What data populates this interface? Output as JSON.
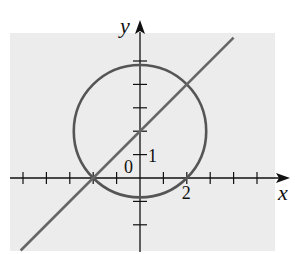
{
  "chart_data": {
    "type": "line",
    "title": "",
    "xlabel": "x",
    "ylabel": "y",
    "xlim": [
      -5.5,
      6.2
    ],
    "ylim": [
      -3.1,
      6.0
    ],
    "grid": false,
    "background": "#ececec",
    "tick_labels": {
      "x": [
        {
          "value": 2,
          "label": "2"
        }
      ],
      "y": [
        {
          "value": 1,
          "label": "1"
        }
      ],
      "origin": "0"
    },
    "x_ticks": [
      -5,
      -4,
      -3,
      -2,
      -1,
      1,
      2,
      3,
      4,
      5
    ],
    "y_ticks": [
      -2,
      -1,
      1,
      2,
      3,
      4,
      5
    ],
    "series": [
      {
        "name": "circle",
        "kind": "circle",
        "equation": "x^2 + (y-2)^2 = 8",
        "center": [
          0,
          2
        ],
        "radius": 2.83,
        "color": "#555555"
      },
      {
        "name": "line",
        "kind": "line",
        "equation": "y = x + 2",
        "slope": 1,
        "intercept": 2,
        "x_range": [
          -5.1,
          4.0
        ],
        "color": "#666666"
      }
    ],
    "intersections": [
      [
        -2,
        0
      ],
      [
        2,
        4
      ]
    ]
  }
}
